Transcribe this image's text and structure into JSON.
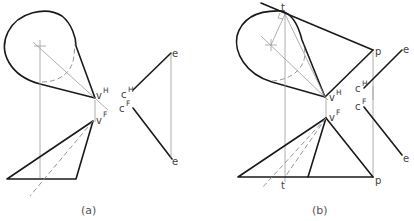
{
  "figure": {
    "panels": [
      {
        "id": "a",
        "caption": "(a)",
        "labels": {
          "v_top": "v",
          "v_top_sup": "H",
          "v_front": "v",
          "v_front_sup": "F",
          "c_top": "c",
          "c_top_sup": "H",
          "c_front": "c",
          "c_front_sup": "F",
          "e_top": "e",
          "e_bottom": "e"
        }
      },
      {
        "id": "b",
        "caption": "(b)",
        "labels": {
          "t_top": "t",
          "t_bottom": "t",
          "p_top": "p",
          "p_bottom": "p",
          "v_top": "v",
          "v_top_sup": "H",
          "v_front": "v",
          "v_front_sup": "F",
          "c_top": "c",
          "c_top_sup": "H",
          "c_front": "c",
          "c_front_sup": "F",
          "e_top": "e",
          "e_bottom": "e"
        }
      }
    ],
    "colors": {
      "object_line": "#1a1a1a",
      "construction_line": "#9a9a9a",
      "label": "#444444"
    }
  }
}
